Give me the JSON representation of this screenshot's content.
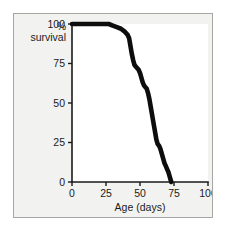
{
  "figure": {
    "background_color": "#f2f2f1",
    "plot_background_color": "#ffffff",
    "border_color": "#a6a6a4",
    "curve_color": "#0d0d0d",
    "axis_color": "#1a1a1a"
  },
  "chart_data": {
    "type": "line",
    "title": "",
    "subtitle": "",
    "xlabel": "Age (days)",
    "ylabel_line1": "%",
    "ylabel_line2": "survival",
    "ylabel": "% survival",
    "xlim": [
      0,
      100
    ],
    "ylim": [
      0,
      100
    ],
    "xticks": [
      0,
      25,
      50,
      75,
      100
    ],
    "yticks": [
      0,
      25,
      50,
      75,
      100
    ],
    "xticklabels": [
      "0",
      "25",
      "50",
      "75",
      "100"
    ],
    "yticklabels": [
      "0",
      "25",
      "50",
      "75",
      "100"
    ],
    "grid": false,
    "legend": null,
    "series": [
      {
        "name": "survival",
        "x": [
          0,
          5,
          10,
          15,
          20,
          25,
          27,
          30,
          33,
          36,
          39,
          41,
          42,
          43,
          44,
          45,
          46,
          47,
          48,
          49,
          50,
          51,
          52,
          53,
          54,
          55,
          56,
          57,
          58,
          59,
          60,
          61,
          62,
          63,
          64,
          65,
          66,
          67,
          68,
          69,
          70,
          71,
          72,
          73
        ],
        "y": [
          100,
          100,
          100,
          100,
          100,
          100,
          100,
          99,
          98,
          97,
          95,
          93,
          91,
          86,
          81,
          77,
          74,
          73,
          72,
          71,
          69,
          66,
          63,
          61,
          60,
          59,
          56,
          52,
          47,
          42,
          37,
          32,
          27,
          24,
          23,
          21,
          18,
          15,
          12,
          10,
          8,
          6,
          3,
          0
        ]
      }
    ]
  }
}
